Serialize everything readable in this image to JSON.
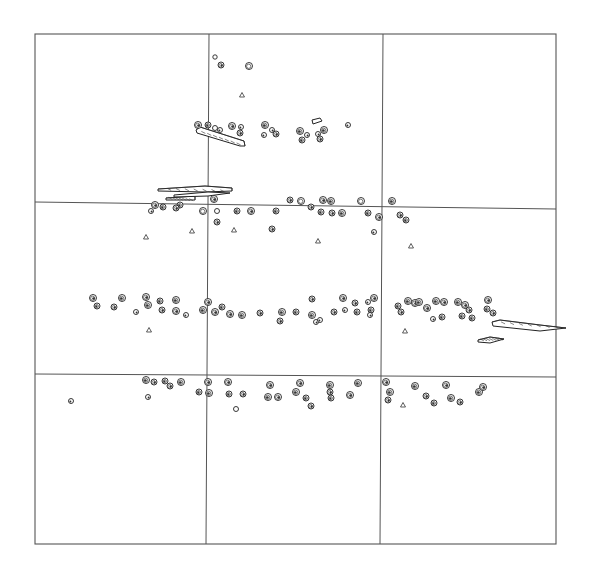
{
  "figure": {
    "type": "site-plan",
    "width": 596,
    "height": 577,
    "colors": {
      "line": "#555555",
      "ink": "#222222",
      "background": "#ffffff"
    },
    "frame": {
      "x1": 35,
      "y1": 34,
      "x2": 556,
      "y2": 544
    },
    "grid": {
      "verticals": [
        {
          "x_top": 209,
          "x_bottom": 206
        },
        {
          "x_top": 383,
          "x_bottom": 380
        }
      ],
      "horizontals": [
        {
          "y_left": 202,
          "y_right": 209
        },
        {
          "y_left": 374,
          "y_right": 377
        }
      ]
    },
    "features": {
      "circles": [
        [
          215,
          57,
          2.2,
          0
        ],
        [
          221,
          65,
          3,
          1
        ],
        [
          249,
          66,
          3.5,
          0
        ],
        [
          198,
          125,
          3.5,
          1
        ],
        [
          208,
          125,
          3,
          1
        ],
        [
          215,
          128,
          2.5,
          0
        ],
        [
          220,
          130,
          2.5,
          1
        ],
        [
          232,
          126,
          3.5,
          1
        ],
        [
          241,
          127,
          2.5,
          1
        ],
        [
          240,
          133,
          3,
          1
        ],
        [
          265,
          125,
          3.5,
          1
        ],
        [
          272,
          130,
          2.5,
          1
        ],
        [
          264,
          135,
          2.5,
          1
        ],
        [
          276,
          134,
          3,
          1
        ],
        [
          300,
          131,
          3.5,
          1
        ],
        [
          307,
          135,
          2.5,
          1
        ],
        [
          302,
          140,
          3,
          1
        ],
        [
          318,
          134,
          2.5,
          1
        ],
        [
          324,
          130,
          3.5,
          1
        ],
        [
          320,
          139,
          3,
          1
        ],
        [
          348,
          125,
          2.5,
          1
        ],
        [
          155,
          205,
          3.5,
          1
        ],
        [
          163,
          207,
          3,
          1
        ],
        [
          151,
          211,
          2.5,
          1
        ],
        [
          180,
          205,
          3,
          1
        ],
        [
          176,
          208,
          3,
          1
        ],
        [
          203,
          211,
          3.5,
          0
        ],
        [
          214,
          199,
          3.5,
          1
        ],
        [
          217,
          211,
          2.5,
          0
        ],
        [
          217,
          222,
          3,
          1
        ],
        [
          237,
          211,
          3,
          1
        ],
        [
          251,
          211,
          3.5,
          1
        ],
        [
          276,
          211,
          3,
          1
        ],
        [
          290,
          200,
          3,
          1
        ],
        [
          301,
          201,
          3.5,
          0
        ],
        [
          311,
          207,
          3,
          1
        ],
        [
          321,
          212,
          3,
          1
        ],
        [
          323,
          200,
          3.5,
          1
        ],
        [
          331,
          201,
          3.5,
          1
        ],
        [
          332,
          213,
          3,
          1
        ],
        [
          342,
          213,
          3.5,
          1
        ],
        [
          361,
          201,
          3.5,
          0
        ],
        [
          368,
          213,
          3,
          1
        ],
        [
          379,
          217,
          3.5,
          1
        ],
        [
          392,
          201,
          3.5,
          1
        ],
        [
          400,
          215,
          3,
          1
        ],
        [
          406,
          220,
          3,
          1
        ],
        [
          272,
          229,
          3,
          1
        ],
        [
          374,
          232,
          2.5,
          1
        ],
        [
          93,
          298,
          3.5,
          1
        ],
        [
          97,
          306,
          3,
          1
        ],
        [
          114,
          307,
          3,
          1
        ],
        [
          122,
          298,
          3.5,
          1
        ],
        [
          136,
          312,
          2.5,
          1
        ],
        [
          148,
          305,
          3.5,
          1
        ],
        [
          146,
          297,
          3.5,
          1
        ],
        [
          160,
          301,
          3,
          1
        ],
        [
          162,
          310,
          3,
          1
        ],
        [
          176,
          300,
          3.5,
          1
        ],
        [
          176,
          311,
          3.5,
          1
        ],
        [
          186,
          315,
          2.5,
          1
        ],
        [
          208,
          302,
          3.5,
          1
        ],
        [
          203,
          310,
          3.5,
          1
        ],
        [
          215,
          312,
          3.5,
          1
        ],
        [
          222,
          307,
          3,
          1
        ],
        [
          230,
          314,
          3.5,
          1
        ],
        [
          242,
          315,
          3.5,
          1
        ],
        [
          260,
          313,
          3,
          1
        ],
        [
          282,
          312,
          3.5,
          1
        ],
        [
          280,
          321,
          3,
          1
        ],
        [
          296,
          312,
          3,
          1
        ],
        [
          312,
          299,
          3,
          1
        ],
        [
          312,
          315,
          3.5,
          1
        ],
        [
          316,
          322,
          2.5,
          1
        ],
        [
          320,
          320,
          2.5,
          1
        ],
        [
          334,
          312,
          3,
          1
        ],
        [
          345,
          310,
          2.5,
          1
        ],
        [
          343,
          298,
          3.5,
          1
        ],
        [
          357,
          312,
          3,
          1
        ],
        [
          355,
          303,
          3,
          1
        ],
        [
          368,
          302,
          2.5,
          1
        ],
        [
          374,
          298,
          3.5,
          1
        ],
        [
          371,
          310,
          3,
          1
        ],
        [
          370,
          315,
          2.5,
          1
        ],
        [
          398,
          306,
          3,
          1
        ],
        [
          401,
          312,
          3,
          1
        ],
        [
          408,
          301,
          3.5,
          1
        ],
        [
          415,
          303,
          3.5,
          1
        ],
        [
          419,
          302,
          3.5,
          1
        ],
        [
          427,
          308,
          3.5,
          1
        ],
        [
          436,
          301,
          3.5,
          1
        ],
        [
          433,
          319,
          2.5,
          1
        ],
        [
          442,
          317,
          3,
          1
        ],
        [
          444,
          302,
          3.5,
          1
        ],
        [
          458,
          302,
          3.5,
          1
        ],
        [
          465,
          305,
          3.5,
          1
        ],
        [
          462,
          316,
          3,
          1
        ],
        [
          469,
          310,
          3,
          1
        ],
        [
          472,
          318,
          3,
          1
        ],
        [
          488,
          300,
          3.5,
          1
        ],
        [
          487,
          309,
          3,
          1
        ],
        [
          493,
          313,
          3,
          1
        ],
        [
          146,
          380,
          3.5,
          1
        ],
        [
          154,
          382,
          3,
          1
        ],
        [
          165,
          381,
          3,
          1
        ],
        [
          170,
          386,
          3,
          1
        ],
        [
          181,
          382,
          3.5,
          1
        ],
        [
          148,
          397,
          2.5,
          1
        ],
        [
          199,
          392,
          3,
          1
        ],
        [
          208,
          382,
          3.5,
          1
        ],
        [
          209,
          393,
          3.5,
          1
        ],
        [
          228,
          382,
          3.5,
          1
        ],
        [
          229,
          394,
          3,
          1
        ],
        [
          243,
          394,
          3,
          1
        ],
        [
          236,
          409,
          2.5,
          0
        ],
        [
          270,
          385,
          3.5,
          1
        ],
        [
          268,
          397,
          3.5,
          1
        ],
        [
          278,
          397,
          3.5,
          1
        ],
        [
          296,
          392,
          3.5,
          1
        ],
        [
          300,
          383,
          3.5,
          1
        ],
        [
          306,
          398,
          3,
          1
        ],
        [
          311,
          406,
          3,
          1
        ],
        [
          330,
          385,
          3.5,
          1
        ],
        [
          330,
          392,
          3,
          1
        ],
        [
          331,
          398,
          3,
          1
        ],
        [
          350,
          395,
          3.5,
          1
        ],
        [
          358,
          383,
          3.5,
          1
        ],
        [
          386,
          382,
          3.5,
          1
        ],
        [
          390,
          392,
          3.5,
          1
        ],
        [
          388,
          400,
          3,
          1
        ],
        [
          415,
          386,
          3.5,
          1
        ],
        [
          426,
          396,
          3,
          1
        ],
        [
          434,
          403,
          3,
          1
        ],
        [
          446,
          385,
          3.5,
          1
        ],
        [
          451,
          398,
          3.5,
          1
        ],
        [
          460,
          402,
          3,
          1
        ],
        [
          479,
          392,
          3.5,
          1
        ],
        [
          483,
          387,
          3.5,
          1
        ],
        [
          71,
          401,
          2.5,
          1
        ]
      ],
      "triangles": [
        [
          242,
          95
        ],
        [
          146,
          237
        ],
        [
          192,
          231
        ],
        [
          234,
          230
        ],
        [
          318,
          241
        ],
        [
          411,
          246
        ],
        [
          149,
          330
        ],
        [
          405,
          331
        ],
        [
          403,
          405
        ]
      ],
      "elongated": [
        {
          "name": "log-1",
          "points": "196,130 200,127 244,141 245,146 240,146 197,133",
          "hatch": true
        },
        {
          "name": "log-2",
          "points": "158,189 205,186 232,188 232,191 205,192 158,191",
          "hatch": true
        },
        {
          "name": "log-3",
          "points": "166,198 195,196 195,200 166,200",
          "hatch": true
        },
        {
          "name": "log-4",
          "points": "174,195 208,192 230,193 208,196 174,197",
          "hatch": false
        },
        {
          "name": "log-5",
          "points": "312,120 320,118 322,121 313,124",
          "hatch": false
        },
        {
          "name": "log-6",
          "points": "492,322 500,320 540,325 566,328 540,331 493,326",
          "hatch": true
        },
        {
          "name": "log-7",
          "points": "478,340 490,337 504,339 490,343 478,342",
          "hatch": true
        }
      ]
    }
  }
}
